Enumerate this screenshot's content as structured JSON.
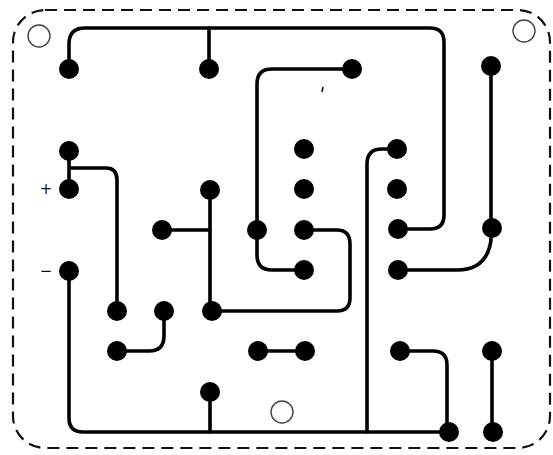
{
  "diagram": {
    "type": "pcb-layout",
    "colors": {
      "background": "#ffffff",
      "ink": "#000000",
      "outline": "#111111",
      "hole": "#444444"
    },
    "outline": {
      "x": 13,
      "y": 10,
      "width": 537,
      "height": 438,
      "radius": 32,
      "dash": "12 7"
    },
    "labels": [
      {
        "id": "plus",
        "text": "+",
        "x": 46,
        "y": 194
      },
      {
        "id": "minus",
        "text": "−",
        "x": 46,
        "y": 276
      }
    ],
    "mounting_holes": [
      {
        "cx": 39,
        "cy": 36,
        "r": 11
      },
      {
        "cx": 524,
        "cy": 31,
        "r": 11
      },
      {
        "cx": 282,
        "cy": 412,
        "r": 11
      }
    ],
    "pads": [
      {
        "id": "p1",
        "cx": 69,
        "cy": 69
      },
      {
        "id": "p2",
        "cx": 209,
        "cy": 69
      },
      {
        "id": "p3",
        "cx": 352,
        "cy": 69
      },
      {
        "id": "p4",
        "cx": 491,
        "cy": 66
      },
      {
        "id": "p5",
        "cx": 69,
        "cy": 151
      },
      {
        "id": "p6",
        "cx": 69,
        "cy": 189
      },
      {
        "id": "p7",
        "cx": 210,
        "cy": 190
      },
      {
        "id": "p8",
        "cx": 304,
        "cy": 149
      },
      {
        "id": "p9",
        "cx": 304,
        "cy": 189
      },
      {
        "id": "p10",
        "cx": 397,
        "cy": 149
      },
      {
        "id": "p11",
        "cx": 397,
        "cy": 189
      },
      {
        "id": "p12",
        "cx": 162,
        "cy": 230
      },
      {
        "id": "p13",
        "cx": 257,
        "cy": 230
      },
      {
        "id": "p14",
        "cx": 304,
        "cy": 230
      },
      {
        "id": "p15",
        "cx": 398,
        "cy": 229
      },
      {
        "id": "p16",
        "cx": 492,
        "cy": 228
      },
      {
        "id": "p17",
        "cx": 69,
        "cy": 271
      },
      {
        "id": "p18",
        "cx": 304,
        "cy": 270
      },
      {
        "id": "p19",
        "cx": 398,
        "cy": 270
      },
      {
        "id": "p20",
        "cx": 117,
        "cy": 311
      },
      {
        "id": "p21",
        "cx": 164,
        "cy": 311
      },
      {
        "id": "p22",
        "cx": 212,
        "cy": 311
      },
      {
        "id": "p23",
        "cx": 117,
        "cy": 351
      },
      {
        "id": "p24",
        "cx": 258,
        "cy": 351
      },
      {
        "id": "p25",
        "cx": 305,
        "cy": 351
      },
      {
        "id": "p26",
        "cx": 400,
        "cy": 351
      },
      {
        "id": "p27",
        "cx": 492,
        "cy": 351
      },
      {
        "id": "p28",
        "cx": 210,
        "cy": 392
      },
      {
        "id": "p29",
        "cx": 449,
        "cy": 432
      },
      {
        "id": "p30",
        "cx": 493,
        "cy": 432
      }
    ],
    "traces": [
      {
        "id": "t-top-bus",
        "d": "M69 69 L69 44 Q69 28 85 28 L430 28 Q444 28 444 42 L444 215 Q444 229 430 229 L398 229"
      },
      {
        "id": "t-top-tap",
        "d": "M209 69 L209 28"
      },
      {
        "id": "t-p3-p18",
        "d": "M352 69 L272 69 Q257 69 257 84 L257 255 Q257 270 272 270 L304 270"
      },
      {
        "id": "t-right-vert",
        "d": "M491 66 L491 228"
      },
      {
        "id": "t-p16-p19",
        "d": "M491 228 L491 240 Q487 270 457 270 L398 270"
      },
      {
        "id": "t-plus",
        "d": "M69 151 L69 189 M69 168 L106 168 Q117 168 117 180 L117 311"
      },
      {
        "id": "t-p7-p22",
        "d": "M210 190 L210 311"
      },
      {
        "id": "t-p12-stub",
        "d": "M162 230 L210 230"
      },
      {
        "id": "t-p14-loop",
        "d": "M304 230 L337 230 Q350 230 350 244 L350 298 Q350 311 337 311 L212 311"
      },
      {
        "id": "t-p10-down",
        "d": "M397 149 L382 149 Q367 149 367 164 L367 432"
      },
      {
        "id": "t-minus-bus",
        "d": "M69 271 L69 418 Q69 432 83 432 L449 432"
      },
      {
        "id": "t-p28-tap",
        "d": "M210 392 L210 432"
      },
      {
        "id": "t-p21-p23",
        "d": "M164 311 L164 336 Q164 351 149 351 L117 351"
      },
      {
        "id": "t-p24-p25",
        "d": "M258 351 L305 351"
      },
      {
        "id": "t-p26-p29",
        "d": "M400 351 L433 351 Q447 351 447 365 L447 432"
      },
      {
        "id": "t-p27-p30",
        "d": "M492 351 L492 432"
      }
    ],
    "specks": [
      {
        "x1": 323,
        "y1": 87,
        "x2": 322,
        "y2": 92
      }
    ]
  }
}
